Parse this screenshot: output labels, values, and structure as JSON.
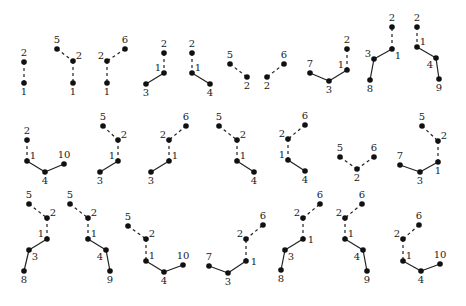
{
  "title": "",
  "chart_data": {
    "type": "diagram",
    "trees": [
      {
        "id": "t1",
        "nodes": [
          {
            "l": "2",
            "x": 24,
            "y": 62,
            "lp": "t"
          },
          {
            "l": "1",
            "x": 24,
            "y": 83,
            "lp": "b"
          }
        ],
        "edges": [
          [
            0,
            1,
            "d"
          ]
        ]
      },
      {
        "id": "t2",
        "nodes": [
          {
            "l": "5",
            "x": 57,
            "y": 49,
            "lp": "t"
          },
          {
            "l": "2",
            "x": 73,
            "y": 61,
            "lp": "tr"
          },
          {
            "l": "1",
            "x": 73,
            "y": 83,
            "lp": "b"
          }
        ],
        "edges": [
          [
            0,
            1,
            "d"
          ],
          [
            1,
            2,
            "d"
          ]
        ]
      },
      {
        "id": "t3",
        "nodes": [
          {
            "l": "6",
            "x": 125,
            "y": 49,
            "lp": "t"
          },
          {
            "l": "2",
            "x": 107,
            "y": 61,
            "lp": "tl"
          },
          {
            "l": "1",
            "x": 107,
            "y": 83,
            "lp": "b"
          }
        ],
        "edges": [
          [
            0,
            1,
            "d"
          ],
          [
            1,
            2,
            "d"
          ]
        ]
      },
      {
        "id": "t4",
        "nodes": [
          {
            "l": "2",
            "x": 164,
            "y": 53,
            "lp": "t"
          },
          {
            "l": "1",
            "x": 164,
            "y": 73,
            "lp": "tl"
          },
          {
            "l": "3",
            "x": 146,
            "y": 84,
            "lp": "b"
          }
        ],
        "edges": [
          [
            0,
            1,
            "d"
          ],
          [
            1,
            2,
            "s"
          ]
        ]
      },
      {
        "id": "t5",
        "nodes": [
          {
            "l": "2",
            "x": 192,
            "y": 53,
            "lp": "t"
          },
          {
            "l": "1",
            "x": 192,
            "y": 73,
            "lp": "tr"
          },
          {
            "l": "4",
            "x": 210,
            "y": 84,
            "lp": "b"
          }
        ],
        "edges": [
          [
            0,
            1,
            "d"
          ],
          [
            1,
            2,
            "s"
          ]
        ]
      },
      {
        "id": "t6",
        "nodes": [
          {
            "l": "5",
            "x": 230,
            "y": 64,
            "lp": "t"
          },
          {
            "l": "2",
            "x": 247,
            "y": 77,
            "lp": "b"
          }
        ],
        "edges": [
          [
            0,
            1,
            "d"
          ]
        ]
      },
      {
        "id": "t7",
        "nodes": [
          {
            "l": "6",
            "x": 284,
            "y": 64,
            "lp": "t"
          },
          {
            "l": "2",
            "x": 267,
            "y": 77,
            "lp": "b"
          }
        ],
        "edges": [
          [
            0,
            1,
            "d"
          ]
        ]
      },
      {
        "id": "t8",
        "nodes": [
          {
            "l": "7",
            "x": 310,
            "y": 73,
            "lp": "t"
          },
          {
            "l": "3",
            "x": 329,
            "y": 81,
            "lp": "b"
          },
          {
            "l": "1",
            "x": 347,
            "y": 70,
            "lp": "tl"
          },
          {
            "l": "2",
            "x": 347,
            "y": 49,
            "lp": "t"
          }
        ],
        "edges": [
          [
            0,
            1,
            "s"
          ],
          [
            1,
            2,
            "s"
          ],
          [
            2,
            3,
            "d"
          ]
        ]
      },
      {
        "id": "t9",
        "nodes": [
          {
            "l": "8",
            "x": 370,
            "y": 80,
            "lp": "b"
          },
          {
            "l": "3",
            "x": 374,
            "y": 59,
            "lp": "tl"
          },
          {
            "l": "1",
            "x": 392,
            "y": 49,
            "lp": "br"
          },
          {
            "l": "2",
            "x": 392,
            "y": 27,
            "lp": "t"
          }
        ],
        "edges": [
          [
            0,
            1,
            "s"
          ],
          [
            1,
            2,
            "s"
          ],
          [
            2,
            3,
            "d"
          ]
        ]
      },
      {
        "id": "t10",
        "nodes": [
          {
            "l": "2",
            "x": 417,
            "y": 27,
            "lp": "t"
          },
          {
            "l": "1",
            "x": 417,
            "y": 47,
            "lp": "tr"
          },
          {
            "l": "4",
            "x": 436,
            "y": 58,
            "lp": "bl"
          },
          {
            "l": "9",
            "x": 439,
            "y": 79,
            "lp": "b"
          }
        ],
        "edges": [
          [
            0,
            1,
            "d"
          ],
          [
            1,
            2,
            "s"
          ],
          [
            2,
            3,
            "s"
          ]
        ]
      },
      {
        "id": "t11",
        "nodes": [
          {
            "l": "2",
            "x": 27,
            "y": 140,
            "lp": "t"
          },
          {
            "l": "1",
            "x": 27,
            "y": 161,
            "lp": "tr"
          },
          {
            "l": "4",
            "x": 45,
            "y": 172,
            "lp": "b"
          },
          {
            "l": "10",
            "x": 64,
            "y": 164,
            "lp": "t"
          }
        ],
        "edges": [
          [
            0,
            1,
            "d"
          ],
          [
            1,
            2,
            "s"
          ],
          [
            2,
            3,
            "s"
          ]
        ]
      },
      {
        "id": "t12",
        "nodes": [
          {
            "l": "5",
            "x": 103,
            "y": 126,
            "lp": "t"
          },
          {
            "l": "2",
            "x": 118,
            "y": 140,
            "lp": "tr"
          },
          {
            "l": "1",
            "x": 118,
            "y": 161,
            "lp": "tl"
          },
          {
            "l": "3",
            "x": 100,
            "y": 172,
            "lp": "b"
          }
        ],
        "edges": [
          [
            0,
            1,
            "d"
          ],
          [
            1,
            2,
            "d"
          ],
          [
            2,
            3,
            "s"
          ]
        ]
      },
      {
        "id": "t13",
        "nodes": [
          {
            "l": "6",
            "x": 186,
            "y": 126,
            "lp": "t"
          },
          {
            "l": "2",
            "x": 169,
            "y": 140,
            "lp": "tl"
          },
          {
            "l": "1",
            "x": 169,
            "y": 161,
            "lp": "tr"
          },
          {
            "l": "3",
            "x": 151,
            "y": 172,
            "lp": "b"
          }
        ],
        "edges": [
          [
            0,
            1,
            "d"
          ],
          [
            1,
            2,
            "d"
          ],
          [
            2,
            3,
            "s"
          ]
        ]
      },
      {
        "id": "t14",
        "nodes": [
          {
            "l": "5",
            "x": 219,
            "y": 126,
            "lp": "t"
          },
          {
            "l": "2",
            "x": 237,
            "y": 140,
            "lp": "tr"
          },
          {
            "l": "1",
            "x": 237,
            "y": 161,
            "lp": "tr"
          },
          {
            "l": "4",
            "x": 254,
            "y": 172,
            "lp": "b"
          }
        ],
        "edges": [
          [
            0,
            1,
            "d"
          ],
          [
            1,
            2,
            "d"
          ],
          [
            2,
            3,
            "s"
          ]
        ]
      },
      {
        "id": "t15",
        "nodes": [
          {
            "l": "6",
            "x": 305,
            "y": 125,
            "lp": "t"
          },
          {
            "l": "2",
            "x": 288,
            "y": 139,
            "lp": "tl"
          },
          {
            "l": "1",
            "x": 288,
            "y": 160,
            "lp": "tl"
          },
          {
            "l": "4",
            "x": 305,
            "y": 171,
            "lp": "b"
          }
        ],
        "edges": [
          [
            0,
            1,
            "d"
          ],
          [
            1,
            2,
            "d"
          ],
          [
            2,
            3,
            "s"
          ]
        ]
      },
      {
        "id": "t16",
        "nodes": [
          {
            "l": "5",
            "x": 340,
            "y": 157,
            "lp": "t"
          },
          {
            "l": "2",
            "x": 357,
            "y": 169,
            "lp": "b"
          },
          {
            "l": "6",
            "x": 374,
            "y": 157,
            "lp": "t"
          }
        ],
        "edges": [
          [
            0,
            1,
            "d"
          ],
          [
            1,
            2,
            "d"
          ]
        ]
      },
      {
        "id": "t17",
        "nodes": [
          {
            "l": "5",
            "x": 422,
            "y": 126,
            "lp": "t"
          },
          {
            "l": "2",
            "x": 438,
            "y": 141,
            "lp": "tr"
          },
          {
            "l": "1",
            "x": 438,
            "y": 162,
            "lp": "b"
          },
          {
            "l": "3",
            "x": 420,
            "y": 172,
            "lp": "b"
          },
          {
            "l": "7",
            "x": 400,
            "y": 165,
            "lp": "t"
          }
        ],
        "edges": [
          [
            0,
            1,
            "d"
          ],
          [
            1,
            2,
            "d"
          ],
          [
            2,
            3,
            "s"
          ],
          [
            3,
            4,
            "s"
          ]
        ]
      },
      {
        "id": "t18",
        "nodes": [
          {
            "l": "5",
            "x": 29,
            "y": 204,
            "lp": "t"
          },
          {
            "l": "2",
            "x": 47,
            "y": 218,
            "lp": "tr"
          },
          {
            "l": "1",
            "x": 47,
            "y": 239,
            "lp": "tl"
          },
          {
            "l": "3",
            "x": 29,
            "y": 250,
            "lp": "br"
          },
          {
            "l": "8",
            "x": 24,
            "y": 271,
            "lp": "b"
          }
        ],
        "edges": [
          [
            0,
            1,
            "d"
          ],
          [
            1,
            2,
            "d"
          ],
          [
            2,
            3,
            "s"
          ],
          [
            3,
            4,
            "s"
          ]
        ]
      },
      {
        "id": "t19",
        "nodes": [
          {
            "l": "5",
            "x": 70,
            "y": 204,
            "lp": "t"
          },
          {
            "l": "2",
            "x": 88,
            "y": 218,
            "lp": "tr"
          },
          {
            "l": "1",
            "x": 88,
            "y": 239,
            "lp": "tr"
          },
          {
            "l": "4",
            "x": 106,
            "y": 250,
            "lp": "bl"
          },
          {
            "l": "9",
            "x": 110,
            "y": 271,
            "lp": "b"
          }
        ],
        "edges": [
          [
            0,
            1,
            "d"
          ],
          [
            1,
            2,
            "d"
          ],
          [
            2,
            3,
            "s"
          ],
          [
            3,
            4,
            "s"
          ]
        ]
      },
      {
        "id": "t20",
        "nodes": [
          {
            "l": "5",
            "x": 128,
            "y": 226,
            "lp": "t"
          },
          {
            "l": "2",
            "x": 146,
            "y": 239,
            "lp": "tr"
          },
          {
            "l": "1",
            "x": 146,
            "y": 261,
            "lp": "tr"
          },
          {
            "l": "4",
            "x": 164,
            "y": 272,
            "lp": "b"
          },
          {
            "l": "10",
            "x": 183,
            "y": 265,
            "lp": "t"
          }
        ],
        "edges": [
          [
            0,
            1,
            "d"
          ],
          [
            1,
            2,
            "d"
          ],
          [
            2,
            3,
            "s"
          ],
          [
            3,
            4,
            "s"
          ]
        ]
      },
      {
        "id": "t21",
        "nodes": [
          {
            "l": "7",
            "x": 209,
            "y": 266,
            "lp": "t"
          },
          {
            "l": "3",
            "x": 228,
            "y": 273,
            "lp": "b"
          },
          {
            "l": "1",
            "x": 246,
            "y": 261,
            "lp": "r"
          },
          {
            "l": "2",
            "x": 246,
            "y": 239,
            "lp": "tl"
          },
          {
            "l": "6",
            "x": 263,
            "y": 225,
            "lp": "t"
          }
        ],
        "edges": [
          [
            0,
            1,
            "s"
          ],
          [
            1,
            2,
            "s"
          ],
          [
            2,
            3,
            "d"
          ],
          [
            3,
            4,
            "d"
          ]
        ]
      },
      {
        "id": "t22",
        "nodes": [
          {
            "l": "8",
            "x": 281,
            "y": 270,
            "lp": "b"
          },
          {
            "l": "3",
            "x": 285,
            "y": 250,
            "lp": "br"
          },
          {
            "l": "1",
            "x": 303,
            "y": 239,
            "lp": "r"
          },
          {
            "l": "2",
            "x": 303,
            "y": 218,
            "lp": "tl"
          },
          {
            "l": "6",
            "x": 320,
            "y": 204,
            "lp": "t"
          }
        ],
        "edges": [
          [
            0,
            1,
            "s"
          ],
          [
            1,
            2,
            "s"
          ],
          [
            2,
            3,
            "d"
          ],
          [
            3,
            4,
            "d"
          ]
        ]
      },
      {
        "id": "t23",
        "nodes": [
          {
            "l": "6",
            "x": 362,
            "y": 204,
            "lp": "t"
          },
          {
            "l": "2",
            "x": 345,
            "y": 218,
            "lp": "tl"
          },
          {
            "l": "1",
            "x": 345,
            "y": 239,
            "lp": "tr"
          },
          {
            "l": "4",
            "x": 363,
            "y": 250,
            "lp": "bl"
          },
          {
            "l": "9",
            "x": 367,
            "y": 271,
            "lp": "b"
          }
        ],
        "edges": [
          [
            0,
            1,
            "d"
          ],
          [
            1,
            2,
            "d"
          ],
          [
            2,
            3,
            "s"
          ],
          [
            3,
            4,
            "s"
          ]
        ]
      },
      {
        "id": "t24",
        "nodes": [
          {
            "l": "6",
            "x": 419,
            "y": 225,
            "lp": "t"
          },
          {
            "l": "2",
            "x": 403,
            "y": 239,
            "lp": "tl"
          },
          {
            "l": "1",
            "x": 403,
            "y": 261,
            "lp": "tr"
          },
          {
            "l": "4",
            "x": 421,
            "y": 271,
            "lp": "b"
          },
          {
            "l": "10",
            "x": 440,
            "y": 264,
            "lp": "t"
          }
        ],
        "edges": [
          [
            0,
            1,
            "d"
          ],
          [
            1,
            2,
            "d"
          ],
          [
            2,
            3,
            "s"
          ],
          [
            3,
            4,
            "s"
          ]
        ]
      }
    ]
  }
}
